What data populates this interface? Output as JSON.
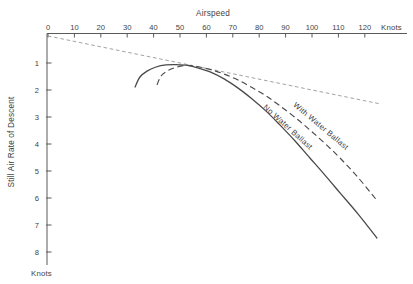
{
  "chart_data": {
    "type": "line",
    "title": "",
    "x_axis": {
      "label": "Airspeed",
      "unit": "Knots",
      "ticks": [
        0,
        10,
        20,
        30,
        40,
        50,
        60,
        70,
        80,
        90,
        100,
        110,
        120
      ],
      "min": 0,
      "max": 136,
      "position": "top"
    },
    "y_axis": {
      "label": "Still Air Rate of Descent",
      "unit": "Knots",
      "ticks": [
        1,
        2,
        3,
        4,
        5,
        6,
        7,
        8
      ],
      "min": 0,
      "max": 8.6,
      "position": "left",
      "direction": "down"
    },
    "grid": false,
    "legend": "inline-rotated-labels",
    "series": [
      {
        "id": "best-glide-tangent",
        "label": "",
        "style": "fine-dashed",
        "points": [
          [
            0,
            0
          ],
          [
            126,
            2.52
          ]
        ]
      },
      {
        "id": "with-water-ballast",
        "label": "With Water Ballast",
        "style": "dashed",
        "points": [
          [
            41.3,
            1.81
          ],
          [
            42.8,
            1.48
          ],
          [
            45.1,
            1.3
          ],
          [
            48.1,
            1.17
          ],
          [
            52.3,
            1.09
          ],
          [
            56.4,
            1.13
          ],
          [
            61.4,
            1.24
          ],
          [
            66.7,
            1.41
          ],
          [
            72.0,
            1.63
          ],
          [
            77.3,
            1.91
          ],
          [
            82.6,
            2.22
          ],
          [
            87.9,
            2.59
          ],
          [
            93.6,
            3.02
          ],
          [
            99.2,
            3.48
          ],
          [
            104.9,
            3.98
          ],
          [
            110.6,
            4.52
          ],
          [
            117.0,
            5.19
          ],
          [
            124.2,
            6.04
          ]
        ]
      },
      {
        "id": "no-water-ballast",
        "label": "No Water Ballast",
        "style": "solid",
        "points": [
          [
            33.0,
            1.89
          ],
          [
            34.8,
            1.52
          ],
          [
            37.5,
            1.3
          ],
          [
            40.9,
            1.15
          ],
          [
            44.7,
            1.07
          ],
          [
            48.5,
            1.06
          ],
          [
            53.0,
            1.09
          ],
          [
            56.4,
            1.17
          ],
          [
            61.4,
            1.33
          ],
          [
            66.7,
            1.59
          ],
          [
            72.0,
            1.93
          ],
          [
            77.3,
            2.33
          ],
          [
            82.6,
            2.78
          ],
          [
            87.9,
            3.3
          ],
          [
            93.6,
            3.89
          ],
          [
            99.2,
            4.52
          ],
          [
            104.9,
            5.15
          ],
          [
            110.6,
            5.81
          ],
          [
            117.4,
            6.59
          ],
          [
            124.6,
            7.48
          ]
        ]
      }
    ],
    "layout": {
      "x0_px": 48,
      "px_per_knot_x": 2.64,
      "y0_px": 36,
      "px_per_knot_y": 27,
      "axis_corner_px": [
        47,
        33.5
      ],
      "x_axis_end_px": 407,
      "y_axis_end_px": 265,
      "x_tick_len_px": 4,
      "y_tick_len_px": 4.5,
      "series_label_anchors": [
        null,
        {
          "x": 321,
          "y": 126,
          "rotate": 40
        },
        {
          "x": 288,
          "y": 127,
          "rotate": 42
        }
      ]
    },
    "colors": {
      "ink": "#3f3f3f",
      "curve": "#4a4a4a",
      "tangent_line": "#979797",
      "background": "#ffffff"
    }
  }
}
